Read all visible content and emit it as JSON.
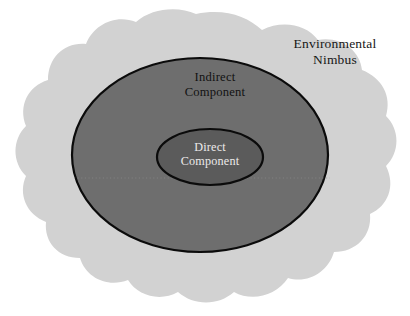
{
  "figure": {
    "background_color": "#ffffff",
    "regions": [
      {
        "key": "nimbus",
        "label": "Environmental\nNimbus",
        "shape": "cloud",
        "fill_color": "#d2d2d2",
        "text_color": "#171717",
        "stroke": "none"
      },
      {
        "key": "indirect",
        "label": "Indirect\nComponent",
        "shape": "ellipse",
        "fill_color": "#6e6e6e",
        "text_color": "#121212",
        "stroke_color": "#0b0b0b",
        "stroke_width": 2.2,
        "center_x": 200,
        "center_y": 155,
        "radius_x": 128,
        "radius_y": 97
      },
      {
        "key": "direct",
        "label": "Direct\nComponent",
        "shape": "ellipse",
        "fill_color": "#5b5b5b",
        "text_color": "#eceaea",
        "stroke_color": "#0b0b0b",
        "stroke_width": 2.2,
        "center_x": 210,
        "center_y": 157,
        "radius_x": 53,
        "radius_y": 28
      }
    ],
    "artifact": {
      "key": "scan-dotted-line",
      "description": "faint horizontal dotted scan artifact",
      "color": "#8f8f8f",
      "y": 178,
      "x_start": 74,
      "x_end": 330
    }
  }
}
